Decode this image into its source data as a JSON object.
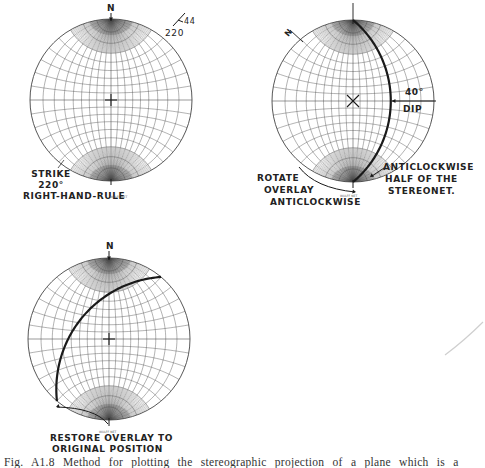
{
  "figure": {
    "caption": "Fig. A1.8 Method for plotting the stereographic projection of a plane which is a",
    "ink_color": "#1a1a1a",
    "grid_color": "#555555",
    "background": "#ffffff"
  },
  "panels": [
    {
      "id": "panel-1",
      "step": "Mark strike on overlay",
      "net": {
        "cx": 111,
        "cy": 100,
        "r": 81,
        "grid_step_deg": 10,
        "center_mark": "plus"
      },
      "north_label": "N",
      "strike_dip_symbol": {
        "strike": "220",
        "dip": "44"
      },
      "labels": {
        "strike_line1": "STRIKE",
        "strike_line2": "220°",
        "strike_line3": "RIGHT-HAND-RULE",
        "net_tag": "WULFF NET"
      }
    },
    {
      "id": "panel-2",
      "step": "Rotate overlay and trace great circle",
      "net": {
        "cx": 353,
        "cy": 101,
        "r": 81,
        "grid_step_deg": 10,
        "center_mark": "x"
      },
      "north_label": "N",
      "overlay_north_rotation_deg": -50,
      "dip_deg": 40,
      "labels": {
        "dip_value": "40°",
        "dip_text": "DIP",
        "rotate_line1": "ROTATE",
        "rotate_line2": "OVERLAY",
        "rotate_line3": "ANTICLOCKWISE",
        "half_line1": "ANTICLOCKWISE",
        "half_line2": "HALF OF THE",
        "half_line3": "STEREONET.",
        "net_tag": "WULFF NET"
      }
    },
    {
      "id": "panel-3",
      "step": "Restore overlay",
      "net": {
        "cx": 109,
        "cy": 339,
        "r": 81,
        "grid_step_deg": 10,
        "center_mark": "plus"
      },
      "north_label": "N",
      "strike_deg": 220,
      "dip_deg": 44,
      "labels": {
        "restore_line1": "RESTORE OVERLAY TO",
        "restore_line2": "ORIGINAL POSITION",
        "net_tag": "WULFF NET"
      }
    }
  ]
}
